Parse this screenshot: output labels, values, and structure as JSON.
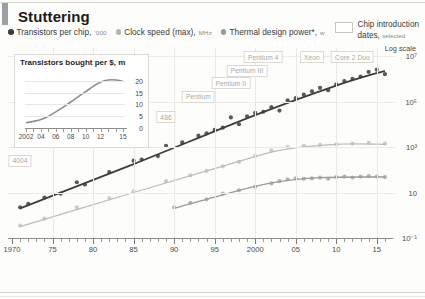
{
  "header": {
    "title": "Stuttering",
    "accent_color": "#9aa0a3",
    "legend": [
      {
        "label": "Transistors per chip,",
        "unit": "'000",
        "color": "#3d3d3d",
        "icon": "series-dot-icon"
      },
      {
        "label": "Clock speed (max),",
        "unit": "MHz",
        "color": "#b5b5b3",
        "icon": "series-dot-icon"
      },
      {
        "label": "Thermal design power*,",
        "unit": "w",
        "color": "#9a9a98",
        "icon": "series-dot-icon"
      }
    ],
    "chip_key": {
      "line1": "Chip introduction",
      "line2": "dates,",
      "line2_sub": "selected",
      "swatch": "chip-box-icon"
    }
  },
  "inset": {
    "title": "Transistors bought per $, m",
    "chart_data": {
      "type": "line",
      "title": "Transistors bought per $, m",
      "xlabel": "",
      "ylabel": "m",
      "x": [
        2002,
        2003,
        2004,
        2005,
        2006,
        2007,
        2008,
        2009,
        2010,
        2011,
        2012,
        2013,
        2014,
        2015
      ],
      "values": [
        2.2,
        2.8,
        3.6,
        5.0,
        6.8,
        8.8,
        11.0,
        13.2,
        15.4,
        17.6,
        19.4,
        20.3,
        20.3,
        19.8
      ],
      "xticks": [
        2002,
        2004,
        2006,
        2008,
        2010,
        2012,
        2015
      ],
      "xticklabels": [
        "2002",
        "04",
        "06",
        "08",
        "10",
        "12",
        "15"
      ],
      "yticks": [
        0,
        5,
        10,
        15,
        20
      ],
      "yticklabels": [
        "0",
        "5",
        "10",
        "15",
        "20"
      ],
      "ylim": [
        0,
        22
      ],
      "grid": true,
      "legend": "none",
      "series_color": "#8e8e8c"
    }
  },
  "main": {
    "log_scale_label": "Log scale",
    "chart_data": {
      "type": "scatter",
      "title": "Stuttering",
      "xlabel": "",
      "ylabel": "Log scale",
      "xlim": [
        1970,
        2017
      ],
      "xticks": [
        1970,
        1975,
        1980,
        1985,
        1990,
        1995,
        2000,
        2005,
        2010,
        2015
      ],
      "xticklabels": [
        "1970",
        "75",
        "80",
        "85",
        "90",
        "95",
        "2000",
        "05",
        "10",
        "15"
      ],
      "ylim": [
        -1,
        7
      ],
      "yticks": [
        7,
        5,
        3,
        1,
        -1
      ],
      "yticklabels": [
        "10⁷",
        "10⁵",
        "10³",
        "10",
        "10⁻¹"
      ],
      "grid": true,
      "log_y": true,
      "legend_position": "top",
      "series": [
        {
          "name": "Transistors per chip, '000",
          "color": "#3d3d3d",
          "trend_color": "#3d3d3d",
          "points": [
            {
              "x": 1971,
              "y": 0.35
            },
            {
              "x": 1972,
              "y": 0.5
            },
            {
              "x": 1974,
              "y": 0.78
            },
            {
              "x": 1976,
              "y": 0.95
            },
            {
              "x": 1978,
              "y": 1.45
            },
            {
              "x": 1979,
              "y": 1.35
            },
            {
              "x": 1982,
              "y": 1.9
            },
            {
              "x": 1985,
              "y": 2.4
            },
            {
              "x": 1986,
              "y": 2.45
            },
            {
              "x": 1988,
              "y": 2.6
            },
            {
              "x": 1989,
              "y": 3.05
            },
            {
              "x": 1991,
              "y": 3.2
            },
            {
              "x": 1993,
              "y": 3.5
            },
            {
              "x": 1994,
              "y": 3.6
            },
            {
              "x": 1995,
              "y": 3.75
            },
            {
              "x": 1996,
              "y": 3.85
            },
            {
              "x": 1997,
              "y": 4.3
            },
            {
              "x": 1998,
              "y": 4.0
            },
            {
              "x": 1999,
              "y": 4.35
            },
            {
              "x": 2000,
              "y": 4.5
            },
            {
              "x": 2001,
              "y": 4.55
            },
            {
              "x": 2002,
              "y": 4.75
            },
            {
              "x": 2003,
              "y": 4.6
            },
            {
              "x": 2004,
              "y": 5.05
            },
            {
              "x": 2005,
              "y": 5.15
            },
            {
              "x": 2006,
              "y": 5.3
            },
            {
              "x": 2007,
              "y": 5.45
            },
            {
              "x": 2008,
              "y": 5.6
            },
            {
              "x": 2009,
              "y": 5.5
            },
            {
              "x": 2010,
              "y": 5.75
            },
            {
              "x": 2011,
              "y": 5.9
            },
            {
              "x": 2012,
              "y": 6.0
            },
            {
              "x": 2013,
              "y": 6.1
            },
            {
              "x": 2014,
              "y": 6.3
            },
            {
              "x": 2015,
              "y": 6.4
            },
            {
              "x": 2016,
              "y": 6.2
            }
          ],
          "trend": [
            {
              "x": 1971,
              "y": 0.3
            },
            {
              "x": 1985,
              "y": 2.25
            },
            {
              "x": 2000,
              "y": 4.4
            },
            {
              "x": 2010,
              "y": 5.7
            },
            {
              "x": 2016,
              "y": 6.35
            }
          ]
        },
        {
          "name": "Clock speed (max), MHz",
          "color": "#c2c2c0",
          "trend_color": "#bdbdbb",
          "points": [
            {
              "x": 1971,
              "y": -0.45
            },
            {
              "x": 1974,
              "y": -0.15
            },
            {
              "x": 1978,
              "y": 0.35
            },
            {
              "x": 1982,
              "y": 0.75
            },
            {
              "x": 1985,
              "y": 1.05
            },
            {
              "x": 1989,
              "y": 1.5
            },
            {
              "x": 1992,
              "y": 1.75
            },
            {
              "x": 1994,
              "y": 1.95
            },
            {
              "x": 1996,
              "y": 2.15
            },
            {
              "x": 1998,
              "y": 2.35
            },
            {
              "x": 2000,
              "y": 2.6
            },
            {
              "x": 2002,
              "y": 2.85
            },
            {
              "x": 2004,
              "y": 3.0
            },
            {
              "x": 2006,
              "y": 3.05
            },
            {
              "x": 2008,
              "y": 3.1
            },
            {
              "x": 2010,
              "y": 3.12
            },
            {
              "x": 2012,
              "y": 3.15
            },
            {
              "x": 2014,
              "y": 3.18
            },
            {
              "x": 2016,
              "y": 3.15
            }
          ],
          "trend": [
            {
              "x": 1971,
              "y": -0.5
            },
            {
              "x": 1985,
              "y": 1.0
            },
            {
              "x": 1995,
              "y": 2.05
            },
            {
              "x": 2003,
              "y": 2.85
            },
            {
              "x": 2010,
              "y": 3.12
            },
            {
              "x": 2016,
              "y": 3.12
            }
          ]
        },
        {
          "name": "Thermal design power*, w",
          "color": "#a8a8a6",
          "trend_color": "#9a9a98",
          "points": [
            {
              "x": 1990,
              "y": 0.35
            },
            {
              "x": 1992,
              "y": 0.55
            },
            {
              "x": 1994,
              "y": 0.7
            },
            {
              "x": 1996,
              "y": 0.95
            },
            {
              "x": 1998,
              "y": 1.1
            },
            {
              "x": 2000,
              "y": 1.25
            },
            {
              "x": 2002,
              "y": 1.4
            },
            {
              "x": 2003,
              "y": 1.5
            },
            {
              "x": 2004,
              "y": 1.58
            },
            {
              "x": 2005,
              "y": 1.62
            },
            {
              "x": 2006,
              "y": 1.6
            },
            {
              "x": 2007,
              "y": 1.62
            },
            {
              "x": 2008,
              "y": 1.65
            },
            {
              "x": 2009,
              "y": 1.6
            },
            {
              "x": 2010,
              "y": 1.68
            },
            {
              "x": 2011,
              "y": 1.7
            },
            {
              "x": 2012,
              "y": 1.66
            },
            {
              "x": 2013,
              "y": 1.7
            },
            {
              "x": 2014,
              "y": 1.72
            },
            {
              "x": 2015,
              "y": 1.7
            },
            {
              "x": 2016,
              "y": 1.68
            }
          ],
          "trend": [
            {
              "x": 1990,
              "y": 0.3
            },
            {
              "x": 1996,
              "y": 0.9
            },
            {
              "x": 2002,
              "y": 1.42
            },
            {
              "x": 2008,
              "y": 1.65
            },
            {
              "x": 2016,
              "y": 1.68
            }
          ]
        }
      ],
      "annotations": [
        {
          "label": "4004",
          "x": 1971,
          "y": 2.45
        },
        {
          "label": "8086",
          "x": 1978,
          "y": 3.6
        },
        {
          "label": "386",
          "x": 1985,
          "y": 3.6
        },
        {
          "label": "486",
          "x": 1989,
          "y": 4.35
        },
        {
          "label": "Pentium",
          "x": 1993,
          "y": 5.25
        },
        {
          "label": "Pentium II",
          "x": 1997,
          "y": 5.85
        },
        {
          "label": "Pentium III",
          "x": 1999,
          "y": 6.4
        },
        {
          "label": "Pentium 4",
          "x": 2001,
          "y": 7.0
        },
        {
          "label": "Xeon",
          "x": 2007,
          "y": 7.0
        },
        {
          "label": "Core 2 Duo",
          "x": 2012,
          "y": 7.0
        }
      ]
    }
  }
}
